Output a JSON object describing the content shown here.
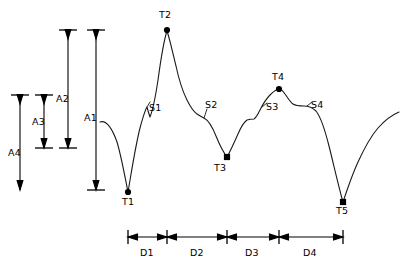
{
  "figure": {
    "stroke_color": "#1a1a1a",
    "background_color": "#ffffff",
    "marker_color": "#000000"
  },
  "turning_points": [
    {
      "id": "T1",
      "label": "T1",
      "x": 128,
      "y": 192,
      "label_x": 122,
      "label_y": 197
    },
    {
      "id": "T2",
      "label": "T2",
      "x": 167,
      "y": 30,
      "label_x": 159,
      "label_y": 10
    },
    {
      "id": "T3",
      "label": "T3",
      "x": 227,
      "y": 157,
      "label_x": 214,
      "label_y": 163
    },
    {
      "id": "T4",
      "label": "T4",
      "x": 279,
      "y": 89,
      "label_x": 272,
      "label_y": 72
    },
    {
      "id": "T5",
      "label": "T5",
      "x": 343,
      "y": 202,
      "label_x": 336,
      "label_y": 206
    }
  ],
  "shoulder_points": [
    {
      "id": "S1",
      "label": "S1",
      "label_x": 149,
      "label_y": 103
    },
    {
      "id": "S2",
      "label": "S2",
      "label_x": 205,
      "label_y": 100
    },
    {
      "id": "S3",
      "label": "S3",
      "label_x": 266,
      "label_y": 102
    },
    {
      "id": "S4",
      "label": "S4",
      "label_x": 311,
      "label_y": 100
    }
  ],
  "amplitudes": [
    {
      "id": "A4",
      "label": "A4",
      "x": 20,
      "top": 95,
      "bottom": 190,
      "label_x": 8,
      "label_y": 148
    },
    {
      "id": "A3",
      "label": "A3",
      "x": 44,
      "top": 95,
      "bottom": 148,
      "label_x": 32,
      "label_y": 117
    },
    {
      "id": "A2",
      "label": "A2",
      "x": 68,
      "top": 30,
      "bottom": 148,
      "label_x": 56,
      "label_y": 94
    },
    {
      "id": "A1",
      "label": "A1",
      "x": 96,
      "top": 30,
      "bottom": 190,
      "label_x": 84,
      "label_y": 113
    }
  ],
  "durations": [
    {
      "id": "D1",
      "label": "D1",
      "start": 128,
      "end": 167,
      "label_x": 140,
      "label_y": 248
    },
    {
      "id": "D2",
      "label": "D2",
      "start": 167,
      "end": 227,
      "label_x": 190,
      "label_y": 248
    },
    {
      "id": "D3",
      "label": "D3",
      "start": 227,
      "end": 279,
      "label_x": 245,
      "label_y": 248
    },
    {
      "id": "D4",
      "label": "D4",
      "start": 279,
      "end": 343,
      "label_x": 303,
      "label_y": 248
    }
  ],
  "duration_axis": {
    "y": 237
  }
}
